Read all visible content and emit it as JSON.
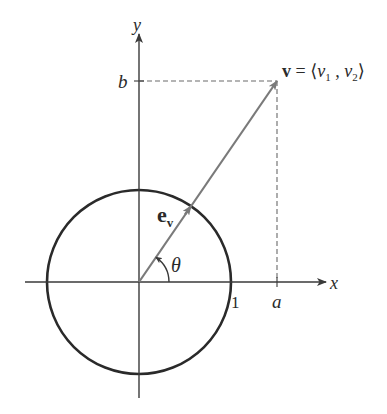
{
  "diagram": {
    "title": "",
    "axes": {
      "x_label": "x",
      "y_label": "y",
      "origin_px": [
        139,
        282
      ],
      "x_range_px": [
        25,
        326
      ],
      "y_range_px": [
        34,
        398
      ]
    },
    "unit_circle": {
      "center_px": [
        139,
        282
      ],
      "radius_px": 92,
      "label": "1",
      "color": "#2a2a2a"
    },
    "vector_v": {
      "from_px": [
        139,
        282
      ],
      "to_px": [
        277,
        81
      ],
      "label_bold": "v",
      "label_rest": " = ⟨",
      "component1": "v",
      "sub1": "1",
      "separator": " , ",
      "component2": "v",
      "sub2": "2",
      "close": "⟩",
      "color": "#7a7a7a"
    },
    "unit_vector": {
      "label_main": "e",
      "label_sub": "v",
      "tip_px": [
        191,
        206
      ]
    },
    "angle": {
      "label": "θ",
      "arc_radius_px": 30
    },
    "tick_labels": {
      "a": "a",
      "b": "b",
      "one": "1"
    },
    "colors": {
      "axis": "#3a3a3a",
      "circle": "#2a2a2a",
      "vector": "#7a7a7a",
      "dashed": "#6a6a6a",
      "text": "#2a2a2a"
    }
  }
}
